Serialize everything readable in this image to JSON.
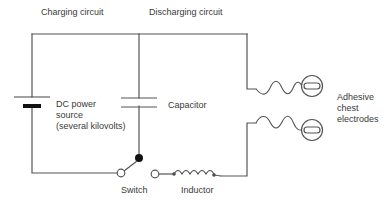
{
  "diagram": {
    "type": "circuit",
    "title_labels": {
      "charging": "Charging circuit",
      "discharging": "Discharging circuit"
    },
    "components": {
      "dc_power_source": "DC power\nsource\n(several kilovolts)",
      "capacitor": "Capacitor",
      "switch": "Switch",
      "inductor": "Inductor",
      "electrodes": "Adhesive\nchest\nelectrodes"
    },
    "colors": {
      "wire": "#555555",
      "text": "#3a3a3a",
      "switch_contact_fill": "#111111",
      "background": "#ffffff"
    }
  }
}
